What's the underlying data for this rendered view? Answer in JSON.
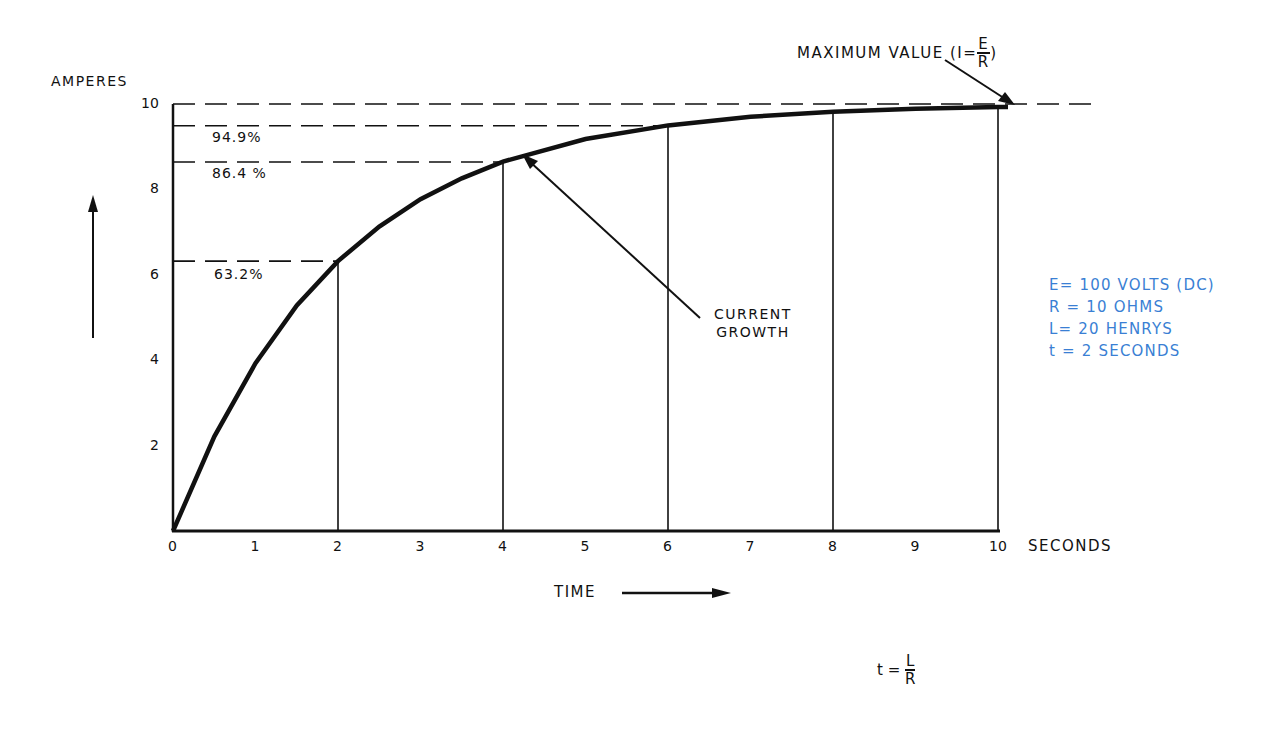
{
  "chart_data": {
    "type": "line",
    "xlabel": "TIME",
    "ylabel": "AMPERES",
    "x_unit": "SECONDS",
    "xlim": [
      0,
      10
    ],
    "ylim": [
      0,
      10
    ],
    "x_ticks": [
      "0",
      "1",
      "2",
      "3",
      "4",
      "5",
      "6",
      "7",
      "8",
      "9",
      "10"
    ],
    "y_ticks": [
      "2",
      "4",
      "6",
      "8",
      "10"
    ],
    "grid": false,
    "series": [
      {
        "name": "CURRENT GROWTH",
        "x": [
          0,
          0.5,
          1,
          1.5,
          2,
          2.5,
          3,
          3.5,
          4,
          5,
          6,
          7,
          8,
          9,
          10
        ],
        "values": [
          0,
          2.21,
          3.93,
          5.28,
          6.32,
          7.13,
          7.77,
          8.26,
          8.65,
          9.18,
          9.5,
          9.7,
          9.82,
          9.89,
          9.93
        ]
      }
    ],
    "reference_lines": [
      {
        "y": 10,
        "label": "MAXIMUM VALUE (I=E/R)"
      },
      {
        "y": 9.49,
        "label": "94.9%"
      },
      {
        "y": 8.64,
        "label": "86.4%"
      },
      {
        "y": 6.32,
        "label": "63.2%"
      }
    ],
    "vertical_markers_x": [
      2,
      4,
      6,
      8,
      10
    ],
    "annotations": [
      "CURRENT GROWTH",
      "MAXIMUM VALUE (I=E/R)"
    ]
  },
  "labels": {
    "y_axis": "AMPERES",
    "x_axis": "TIME",
    "x_unit": "SECONDS",
    "curve": [
      "CURRENT",
      "GROWTH"
    ],
    "maximum_prefix": "MAXIMUM VALUE (I=",
    "maximum_num": "E",
    "maximum_den": "R",
    "maximum_suffix": ")",
    "pct_949": "94.9%",
    "pct_864": "86.4 %",
    "pct_632": "63.2%"
  },
  "parameters": [
    "E= 100 VOLTS (DC)",
    "R = 10 OHMS",
    "L= 20 HENRYS",
    "t = 2 SECONDS"
  ],
  "formula": {
    "lhs": "t =",
    "num": "L",
    "den": "R"
  },
  "colors": {
    "ink": "#111111",
    "parameters": "#3a7fd4"
  }
}
